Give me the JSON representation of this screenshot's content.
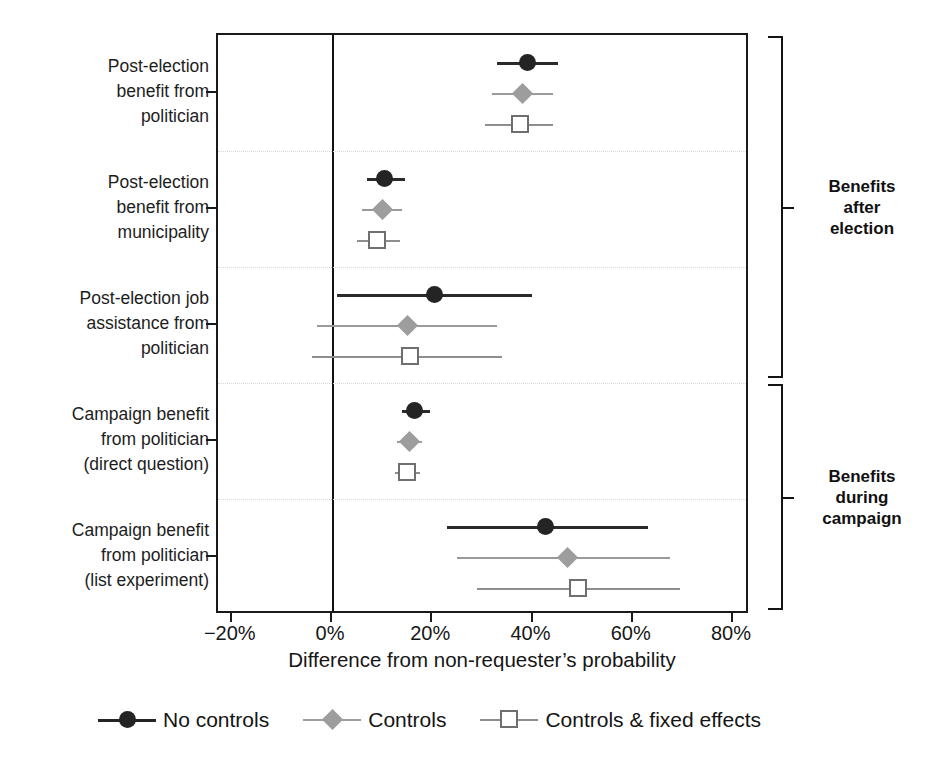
{
  "chart_data": {
    "type": "scatter",
    "title": "",
    "subtitle": "",
    "xlabel": "Difference from non-requester’s probability",
    "ylabel": "",
    "xlim": [
      -20,
      80
    ],
    "xticks": [
      -20,
      0,
      20,
      40,
      60,
      80
    ],
    "xtick_labels": [
      "−20%",
      "0%",
      "20%",
      "40%",
      "60%",
      "80%"
    ],
    "grid": false,
    "reference_line": 0,
    "legend_position": "bottom",
    "units": "percent",
    "note": "Coefficient plot with point estimates and horizontal confidence intervals; three model specifications per outcome.",
    "categories": [
      "Post-election\nbenefit from\npolitician",
      "Post-election\nbenefit from\nmunicipality",
      "Post-election job\nassistance from\npolitician",
      "Campaign benefit\nfrom politician\n(direct question)",
      "Campaign benefit\nfrom politician\n(list experiment)"
    ],
    "series": [
      {
        "name": "No controls",
        "marker": "filled-circle",
        "color": "#242424",
        "estimates": [
          39.0,
          10.5,
          20.5,
          16.5,
          42.5
        ],
        "ci_low": [
          33.0,
          7.0,
          1.0,
          14.0,
          23.0
        ],
        "ci_high": [
          45.0,
          14.5,
          40.0,
          19.5,
          63.0
        ]
      },
      {
        "name": "Controls",
        "marker": "filled-diamond",
        "color": "#9d9d9d",
        "estimates": [
          38.0,
          10.0,
          15.0,
          15.5,
          47.0
        ],
        "ci_low": [
          32.0,
          6.0,
          -3.0,
          13.0,
          25.0
        ],
        "ci_high": [
          44.0,
          14.0,
          33.0,
          18.0,
          67.5
        ]
      },
      {
        "name": "Controls & fixed effects",
        "marker": "open-square",
        "color": "#6f6f6f",
        "estimates": [
          37.5,
          9.0,
          15.5,
          15.0,
          49.0
        ],
        "ci_low": [
          30.5,
          5.0,
          -4.0,
          12.5,
          29.0
        ],
        "ci_high": [
          44.0,
          13.5,
          34.0,
          17.5,
          69.5
        ]
      }
    ],
    "annotations": [
      {
        "label": "Benefits\nafter\nelection",
        "covers": [
          0,
          1,
          2
        ]
      },
      {
        "label": "Benefits\nduring\ncampaign",
        "covers": [
          3,
          4
        ]
      }
    ]
  }
}
